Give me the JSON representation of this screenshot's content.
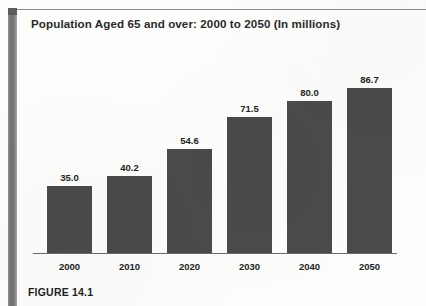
{
  "figure": {
    "caption": "FIGURE 14.1"
  },
  "colors": {
    "bar_fill": "#4a4a4a",
    "axis_line": "#6b6b6b",
    "title_text": "#2a2a2a",
    "label_text": "#232323",
    "page_background": "#fdfdfc",
    "gutter_shadow": "#6f6f6f"
  },
  "chart_data": {
    "type": "bar",
    "title": "Population Aged 65 and over: 2000 to 2050 (In millions)",
    "xlabel": "",
    "ylabel": "",
    "categories": [
      "2000",
      "2010",
      "2020",
      "2030",
      "2040",
      "2050"
    ],
    "values": [
      35.0,
      40.2,
      54.6,
      71.5,
      80.0,
      86.7
    ],
    "value_labels": [
      "35.0",
      "40.2",
      "54.6",
      "71.5",
      "80.0",
      "86.7"
    ],
    "ylim": [
      0,
      86.7
    ],
    "grid": false,
    "legend": null,
    "units": "millions"
  }
}
